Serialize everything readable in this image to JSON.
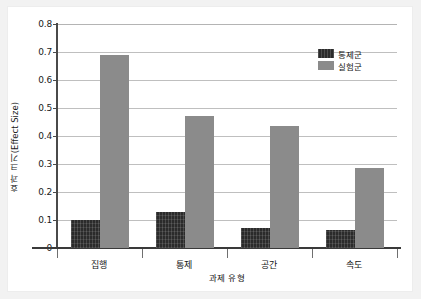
{
  "chart_data": {
    "type": "bar",
    "title": "",
    "xlabel": "과제 유형",
    "ylabel": "효과 크기(Effect Size)",
    "categories": [
      "집행",
      "통제",
      "공간",
      "속도"
    ],
    "series": [
      {
        "name": "통제군",
        "color": "#2b2b2b",
        "values": [
          0.1,
          0.13,
          0.07,
          0.065
        ]
      },
      {
        "name": "실험군",
        "color": "#8b8b8b",
        "values": [
          0.69,
          0.47,
          0.435,
          0.285
        ]
      }
    ],
    "ylim": [
      0,
      0.8
    ],
    "ytick_step": 0.1,
    "yticks": [
      "0.8",
      "0.7",
      "0.6",
      "0.5",
      "0.4",
      "0.3",
      "0.2",
      "0.1",
      "0"
    ],
    "ytick_values": [
      0.8,
      0.7,
      0.6,
      0.5,
      0.4,
      0.3,
      0.2,
      0.1,
      0.0
    ],
    "grid": true,
    "legend_position": "top-right",
    "background_color": "#ffffff",
    "figure_background_color": "#f2f2f2",
    "gridline_color": "#bfbfbf",
    "axis_color": "#3a3a3a"
  },
  "legend": {
    "entries": [
      {
        "label": "통제군",
        "swatch": "control"
      },
      {
        "label": "실험군",
        "swatch": "experimental"
      }
    ]
  }
}
